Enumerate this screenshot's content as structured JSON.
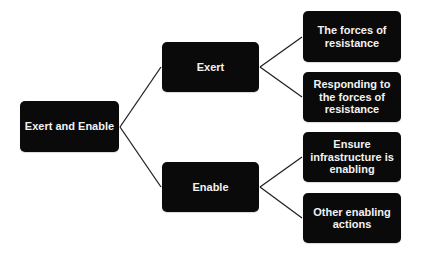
{
  "diagram": {
    "type": "tree",
    "root": {
      "label": "Exert and Enable"
    },
    "branches": [
      {
        "label": "Exert",
        "children": [
          {
            "label": "The forces of resistance"
          },
          {
            "label": "Responding to the forces of resistance"
          }
        ]
      },
      {
        "label": "Enable",
        "children": [
          {
            "label": "Ensure infrastructure is enabling"
          },
          {
            "label": "Other enabling actions"
          }
        ]
      }
    ]
  },
  "colors": {
    "node_fill": "#0a0a0a",
    "node_text": "#f2f2f2",
    "connector": "#222222",
    "background": "#ffffff"
  }
}
